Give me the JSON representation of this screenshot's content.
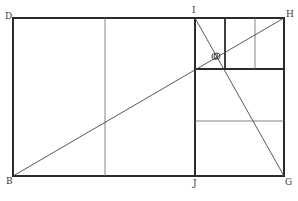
{
  "diagram": {
    "stroke_color": "#2b2b2b",
    "thin_color": "#555555",
    "background": "#ffffff",
    "labels": {
      "D": "D",
      "I": "I",
      "H": "H",
      "O": "O",
      "B": "B",
      "J": "J",
      "G": "G"
    },
    "points": {
      "D": [
        13,
        18
      ],
      "I": [
        195,
        18
      ],
      "H": [
        284,
        18
      ],
      "B": [
        13,
        176
      ],
      "J": [
        195,
        176
      ],
      "G": [
        284,
        176
      ],
      "O": [
        217,
        56
      ]
    },
    "lines": [
      {
        "name": "outer-rectangle",
        "type": "rect",
        "weight": "thick"
      },
      {
        "name": "divider-IJ",
        "from": "I",
        "to": "J",
        "weight": "thick"
      },
      {
        "name": "diagonal-BH",
        "from": "B",
        "to": "H",
        "weight": "thin"
      },
      {
        "name": "diagonal-IG",
        "from": "I",
        "to": "G",
        "weight": "thin"
      }
    ]
  }
}
